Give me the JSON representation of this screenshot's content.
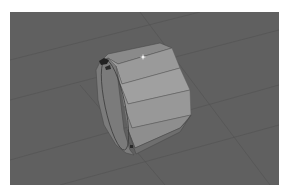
{
  "viewport": {
    "type": "3d-viewport",
    "background_color": "#606060",
    "grid_color": "#525252",
    "object": {
      "name": "octagonal-ring",
      "shape": "octagonal cylinder ring",
      "colors": {
        "top_face": "#8a8a8a",
        "face_light": "#a0a0a0",
        "face_mid": "#959595",
        "face_dark": "#6e6e6e",
        "inner_rim": "#7b7b7b",
        "edge": "#4a4a4a"
      }
    },
    "cursor": {
      "x": 143,
      "y": 57
    }
  }
}
